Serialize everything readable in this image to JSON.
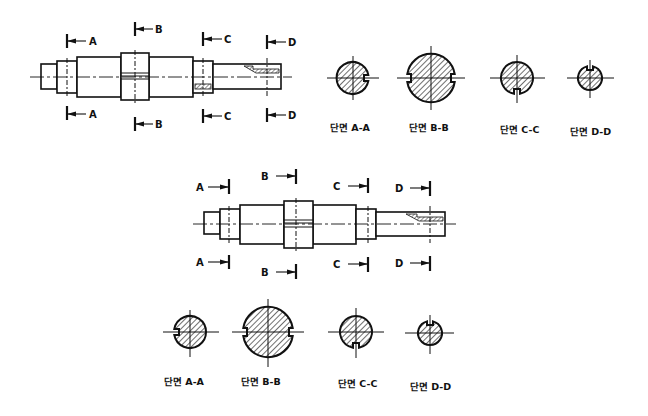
{
  "drawings": [
    {
      "id": "top",
      "cut_labels": {
        "A": "A",
        "B": "B",
        "C": "C",
        "D": "D"
      },
      "sections": [
        {
          "label": "단면 A-A",
          "notch": "right"
        },
        {
          "label": "단면 B-B",
          "notch": "left-right"
        },
        {
          "label": "단면 C-C",
          "notch": "bottom"
        },
        {
          "label": "단면 D-D",
          "notch": "top"
        }
      ]
    },
    {
      "id": "bottom",
      "cut_labels": {
        "A": "A",
        "B": "B",
        "C": "C",
        "D": "D"
      },
      "sections": [
        {
          "label": "단면 A-A",
          "notch": "left"
        },
        {
          "label": "단면 B-B",
          "notch": "left-right"
        },
        {
          "label": "단면 C-C",
          "notch": "bottom"
        },
        {
          "label": "단면 D-D",
          "notch": "top"
        }
      ]
    }
  ],
  "colors": {
    "line": "#111111",
    "background": "#ffffff"
  }
}
